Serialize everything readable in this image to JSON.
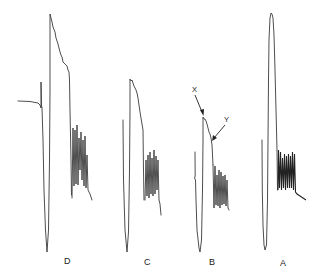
{
  "figure": {
    "background_color": "#ffffff",
    "trace_color": "#3a3a3a",
    "traces": [
      {
        "id": "D",
        "label": "D"
      },
      {
        "id": "C",
        "label": "C"
      },
      {
        "id": "B",
        "label": "B"
      },
      {
        "id": "A",
        "label": "A"
      }
    ],
    "annotations": [
      {
        "id": "X",
        "label": "X",
        "target_trace": "B"
      },
      {
        "id": "Y",
        "label": "Y",
        "target_trace": "B"
      }
    ]
  }
}
